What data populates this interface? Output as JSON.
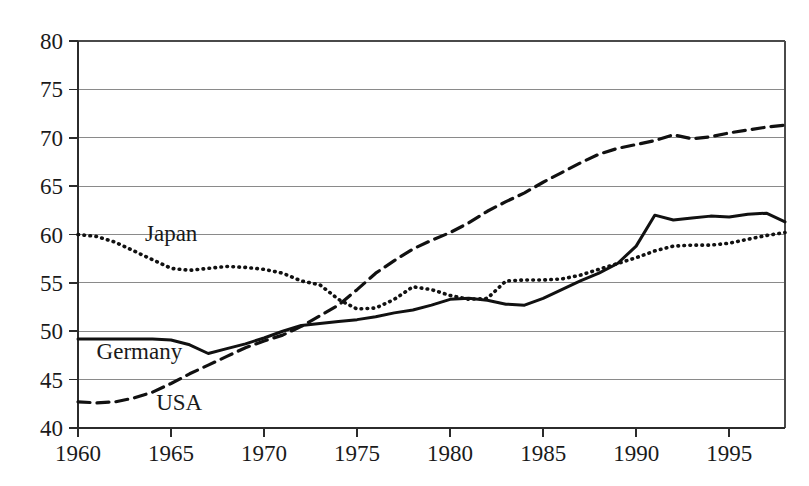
{
  "chart_data": {
    "type": "line",
    "title": "",
    "subtitle": "",
    "xlabel": "",
    "ylabel": "",
    "xlim": [
      1960,
      1998
    ],
    "ylim": [
      40,
      80
    ],
    "grid": true,
    "grid_axis": "y",
    "legend_position": "inline-annotations",
    "yticks": [
      40,
      45,
      50,
      55,
      60,
      65,
      70,
      75,
      80
    ],
    "ytick_labels": [
      "40",
      "45",
      "50",
      "55",
      "60",
      "65",
      "70",
      "75",
      "80"
    ],
    "xticks": [
      1960,
      1965,
      1970,
      1975,
      1980,
      1985,
      1990,
      1995
    ],
    "xtick_labels": [
      "1960",
      "1965",
      "1970",
      "1975",
      "1980",
      "1985",
      "1990",
      "1995"
    ],
    "x": [
      1960,
      1961,
      1962,
      1963,
      1964,
      1965,
      1966,
      1967,
      1968,
      1969,
      1970,
      1971,
      1972,
      1973,
      1974,
      1975,
      1976,
      1977,
      1978,
      1979,
      1980,
      1981,
      1982,
      1983,
      1984,
      1985,
      1986,
      1987,
      1988,
      1989,
      1990,
      1991,
      1992,
      1993,
      1994,
      1995,
      1996,
      1997,
      1998
    ],
    "series": [
      {
        "name": "Japan",
        "style": "dotted",
        "color": "#111111",
        "label_x": 1963.6,
        "label_y": 59.3,
        "values": [
          60.0,
          59.8,
          59.2,
          58.3,
          57.4,
          56.5,
          56.3,
          56.5,
          56.7,
          56.6,
          56.4,
          56.0,
          55.2,
          54.8,
          53.3,
          52.3,
          52.4,
          53.3,
          54.6,
          54.3,
          53.7,
          53.3,
          53.4,
          55.2,
          55.3,
          55.3,
          55.4,
          55.8,
          56.4,
          57.0,
          57.6,
          58.3,
          58.8,
          58.9,
          58.9,
          59.1,
          59.5,
          59.9,
          60.2
        ]
      },
      {
        "name": "Germany",
        "style": "solid",
        "color": "#111111",
        "label_x": 1961.0,
        "label_y": 47.1,
        "values": [
          49.2,
          49.2,
          49.2,
          49.2,
          49.2,
          49.1,
          48.6,
          47.7,
          48.2,
          48.7,
          49.3,
          50.0,
          50.6,
          50.8,
          51.0,
          51.2,
          51.5,
          51.9,
          52.2,
          52.7,
          53.3,
          53.4,
          53.2,
          52.8,
          52.7,
          53.4,
          54.3,
          55.2,
          56.0,
          57.0,
          58.8,
          62.0,
          61.5,
          61.7,
          61.9,
          61.8,
          62.1,
          62.2,
          61.3
        ]
      },
      {
        "name": "USA",
        "style": "dashed",
        "color": "#111111",
        "label_x": 1964.2,
        "label_y": 41.9,
        "values": [
          42.7,
          42.6,
          42.7,
          43.1,
          43.7,
          44.6,
          45.6,
          46.5,
          47.4,
          48.3,
          49.0,
          49.6,
          50.5,
          51.6,
          52.7,
          54.3,
          56.0,
          57.3,
          58.5,
          59.4,
          60.2,
          61.2,
          62.4,
          63.4,
          64.3,
          65.4,
          66.4,
          67.4,
          68.3,
          68.9,
          69.3,
          69.7,
          70.3,
          69.9,
          70.1,
          70.5,
          70.8,
          71.1,
          71.3
        ]
      }
    ]
  }
}
